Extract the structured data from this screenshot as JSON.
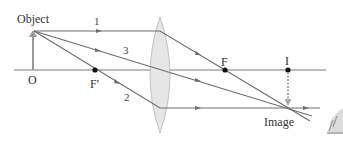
{
  "labels": {
    "object": "Object",
    "origin": "O",
    "focal_front": "F′",
    "focal_back": "F",
    "image_point": "I",
    "image": "Image",
    "ray1": "1",
    "ray2": "2",
    "ray3": "3"
  },
  "colors": {
    "ray": "#6e6e6e",
    "axis": "#7a7a7a",
    "lens_fill": "#e6e6e6",
    "lens_stroke": "#b5b5b5",
    "object_arrow": "#9a9a9a",
    "image_arrow": "#a8a8a8",
    "point": "#111111"
  },
  "geometry": {
    "axis_y": 70,
    "object_x": 33,
    "object_top_y": 31,
    "lens_x": 160,
    "focal_front_x": 95,
    "focal_back_x": 225,
    "image_x": 288,
    "image_y": 108
  }
}
